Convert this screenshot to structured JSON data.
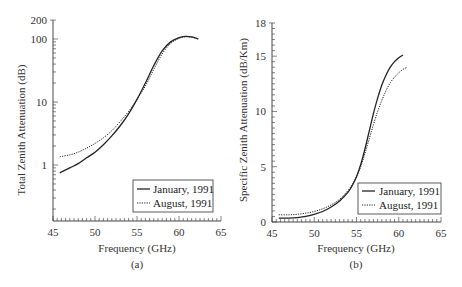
{
  "figure": {
    "panel_a_caption": "(a)",
    "panel_b_caption": "(b)"
  },
  "chart_data": [
    {
      "type": "line",
      "panel": "(a)",
      "title": "",
      "xlabel": "Frequency (GHz)",
      "ylabel": "Total Zenith Attenuation (dB)",
      "yscale": "log",
      "xlim": [
        45,
        65
      ],
      "ylim": [
        0.1,
        200
      ],
      "xticks": [
        45,
        50,
        55,
        60,
        65
      ],
      "yticks": [
        1,
        10,
        100,
        200
      ],
      "grid": false,
      "legend_position": "lower right",
      "series": [
        {
          "name": "January, 1991",
          "style": "solid",
          "x": [
            45.8,
            47,
            48,
            49,
            50,
            51,
            52,
            53,
            54,
            55,
            56,
            57,
            58,
            59,
            60,
            60.7,
            61.5,
            62.3
          ],
          "y": [
            0.75,
            0.9,
            1.05,
            1.3,
            1.6,
            2.1,
            2.9,
            4.2,
            6.5,
            11,
            20,
            38,
            65,
            90,
            105,
            110,
            108,
            100
          ]
        },
        {
          "name": "August, 1991",
          "style": "dotted",
          "x": [
            45.8,
            47,
            48,
            49,
            50,
            51,
            52,
            53,
            54,
            55,
            56,
            57,
            58,
            59,
            60,
            60.7,
            61.5,
            62.3
          ],
          "y": [
            1.35,
            1.45,
            1.6,
            1.85,
            2.2,
            2.7,
            3.5,
            4.9,
            7.1,
            11,
            18,
            33,
            58,
            85,
            102,
            108,
            107,
            100
          ]
        }
      ]
    },
    {
      "type": "line",
      "panel": "(b)",
      "title": "",
      "xlabel": "Frequency (GHz)",
      "ylabel": "Specific Zenith Attenuation (dB/Km)",
      "yscale": "linear",
      "xlim": [
        45,
        65
      ],
      "ylim": [
        0,
        18
      ],
      "xticks": [
        45,
        50,
        55,
        60,
        65
      ],
      "yticks": [
        0,
        5,
        10,
        15,
        18
      ],
      "grid": false,
      "legend_position": "lower right",
      "series": [
        {
          "name": "January, 1991",
          "style": "solid",
          "x": [
            45.8,
            47,
            48,
            49,
            50,
            51,
            52,
            53,
            54,
            54.5,
            55,
            55.5,
            56,
            56.5,
            57,
            57.5,
            58,
            58.5,
            59,
            59.5,
            60,
            60.5
          ],
          "y": [
            0.35,
            0.35,
            0.4,
            0.5,
            0.7,
            0.95,
            1.35,
            1.9,
            2.7,
            3.3,
            4.1,
            5.2,
            6.6,
            8.2,
            9.8,
            11.2,
            12.4,
            13.3,
            14.0,
            14.5,
            14.85,
            15.1
          ]
        },
        {
          "name": "August, 1991",
          "style": "dotted",
          "x": [
            45.8,
            47,
            48,
            49,
            50,
            51,
            52,
            53,
            54,
            54.5,
            55,
            55.5,
            56,
            56.5,
            57,
            57.5,
            58,
            58.5,
            59,
            59.5,
            60,
            60.5,
            61
          ],
          "y": [
            0.65,
            0.65,
            0.7,
            0.8,
            0.95,
            1.2,
            1.55,
            2.05,
            2.85,
            3.4,
            4.1,
            5.0,
            6.2,
            7.5,
            8.8,
            10.0,
            11.0,
            11.9,
            12.6,
            13.1,
            13.5,
            13.8,
            14.0
          ]
        }
      ]
    }
  ]
}
